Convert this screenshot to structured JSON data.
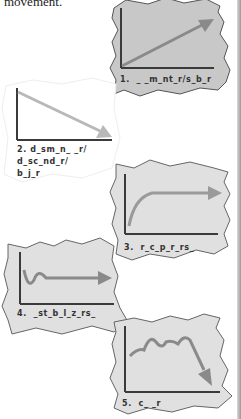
{
  "intro_text": "movement.",
  "colors": {
    "card_fill": "#c8c8c8",
    "card_fill_light": "#e0e0e0",
    "card_stroke": "#555555",
    "axis": "#3a3a3a",
    "arrow": "#8a8a8a",
    "arrow_light": "#b8b8b8"
  },
  "cards": [
    {
      "number": "1.",
      "label": "1.  _ _m_nt_r/s_b_r",
      "shape": "rising-line"
    },
    {
      "number": "2.",
      "label_lines": [
        "2. d_sm_n_ _r/",
        "d_sc_nd_r/",
        "b_j_r"
      ],
      "shape": "falling-line"
    },
    {
      "number": "3.",
      "label": "3.  r_c_p_r_rs_",
      "shape": "rise-then-plateau"
    },
    {
      "number": "4.",
      "label": "4.  _st_b_l_z_rs_",
      "shape": "dip-then-flat"
    },
    {
      "number": "5.",
      "label": "5.  c_ _r",
      "shape": "wavy-then-decline"
    }
  ]
}
